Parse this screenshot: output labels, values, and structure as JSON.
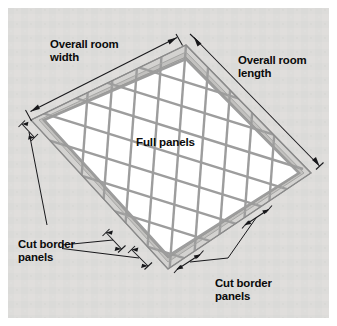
{
  "figure": {
    "background_color": "#dcdcdc",
    "page_color": "#ffffff",
    "panel_color": "#ffffff",
    "grid_color": "#9d9d9d",
    "frame_color": "#d3d2d0",
    "ink_color": "#17171a"
  },
  "labels": {
    "overall_width": {
      "line1": "Overall room",
      "line2": "width"
    },
    "overall_length": {
      "line1": "Overall room",
      "line2": "length"
    },
    "full_panels": {
      "line1": "Full panels"
    },
    "cut_border_left": {
      "line1": "Cut border",
      "line2": "panels"
    },
    "cut_border_bottom": {
      "line1": "Cut border",
      "line2": "panels"
    }
  },
  "geometry": {
    "corner_top": [
      186,
      45
    ],
    "corner_right": [
      311,
      173
    ],
    "corner_bottom": [
      168,
      269
    ],
    "corner_left": [
      31,
      120
    ],
    "grid_columns": 5,
    "grid_rows": 6,
    "border_rings": 1
  },
  "dimensions": [
    {
      "name": "overall-room-width",
      "edge": "top-left",
      "arrows": "both"
    },
    {
      "name": "overall-room-length",
      "edge": "top-right",
      "arrows": "both"
    },
    {
      "name": "cut-border-left-upper",
      "edge": "left",
      "arrows": "both"
    },
    {
      "name": "cut-border-bottom-left-a",
      "edge": "bottom-left",
      "arrows": "both"
    },
    {
      "name": "cut-border-bottom-left-b",
      "edge": "bottom-left",
      "arrows": "both"
    },
    {
      "name": "cut-border-bottom-right-a",
      "edge": "bottom-right",
      "arrows": "both"
    },
    {
      "name": "cut-border-bottom-right-b",
      "edge": "bottom-right",
      "arrows": "both"
    }
  ]
}
